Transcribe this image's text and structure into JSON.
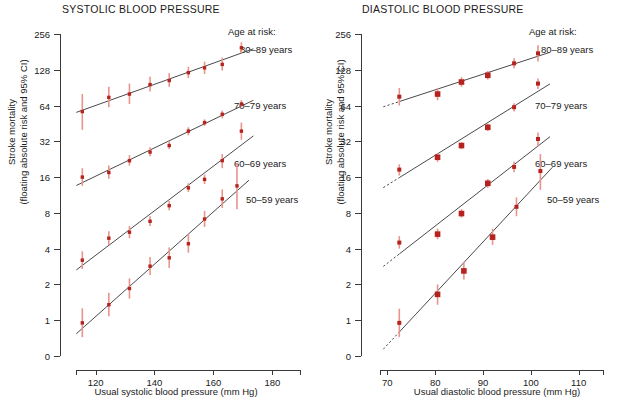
{
  "figure": {
    "ylabel_line1": "Stroke mortality",
    "ylabel_line2": "(floating absolute risk and 95% CI)",
    "legend_heading": "Age at risk:",
    "legend_items": [
      "80–89 years",
      "70–79 years",
      "60–69 years",
      "50–59 years"
    ],
    "point_color": "#b5231f",
    "ci_color": "#e8948c",
    "line_color": "#4a4a4a"
  },
  "chart_data": [
    {
      "type": "scatter",
      "title": "SYSTOLIC BLOOD PRESSURE",
      "xlabel": "Usual systolic blood pressure (mm Hg)",
      "ylabel": "Stroke mortality (floating absolute risk and 95% CI)",
      "yscale": "log2",
      "yticks": [
        0,
        1,
        2,
        4,
        8,
        16,
        32,
        64,
        128,
        256
      ],
      "ytick_labels": [
        "0",
        "1",
        "2",
        "4",
        "8",
        "16",
        "32",
        "64",
        "128",
        "256"
      ],
      "xticks": [
        120,
        140,
        160,
        180
      ],
      "xtick_labels": [
        "120",
        "140",
        "160",
        "180"
      ],
      "xlim": [
        112,
        186
      ],
      "grid": false,
      "legend_position": "right",
      "series": [
        {
          "name": "80–89 years",
          "x": [
            115.5,
            124.5,
            131.5,
            138.5,
            145.0,
            151.5,
            157.0,
            163.0,
            169.5
          ],
          "values": [
            57,
            75,
            80,
            96,
            104,
            121,
            133,
            142,
            196
          ],
          "ci_low": [
            40,
            62,
            66,
            84,
            92,
            109,
            118,
            126,
            176
          ],
          "ci_high": [
            80,
            92,
            98,
            112,
            120,
            136,
            150,
            162,
            218
          ]
        },
        {
          "name": "70–79 years",
          "x": [
            115.5,
            124.5,
            131.5,
            138.5,
            145.0,
            151.5,
            157.0,
            163.0,
            169.5
          ],
          "values": [
            16,
            17.5,
            22,
            26,
            29.5,
            39,
            46,
            54,
            66,
            99
          ],
          "ci_low": [
            13.5,
            15.5,
            20,
            24,
            27.5,
            36,
            43,
            50,
            62,
            90
          ],
          "ci_high": [
            19,
            20,
            24.5,
            28.5,
            32,
            42,
            49,
            58,
            71,
            109
          ]
        },
        {
          "name": "60–69 years",
          "x": [
            115.5,
            124.5,
            131.5,
            138.5,
            145.0,
            151.5,
            157.0,
            163.0,
            169.5
          ],
          "values": [
            3.2,
            4.9,
            5.5,
            6.8,
            9.2,
            13.0,
            15.3,
            22.0,
            39.0
          ],
          "ci_low": [
            2.7,
            4.3,
            4.9,
            6.2,
            8.4,
            12.0,
            14.0,
            19.0,
            33.0
          ],
          "ci_high": [
            3.8,
            5.6,
            6.2,
            7.5,
            10.1,
            14.2,
            16.8,
            25.0,
            46.0
          ]
        },
        {
          "name": "50–59 years",
          "x": [
            115.5,
            124.5,
            131.5,
            138.5,
            145.0,
            151.5,
            157.0,
            163.0,
            168.0
          ],
          "values": [
            0.95,
            1.35,
            1.85,
            2.85,
            3.35,
            4.4,
            7.1,
            10.5,
            13.5
          ],
          "ci_low": [
            0.72,
            1.08,
            1.52,
            2.4,
            2.75,
            3.7,
            6.1,
            8.8,
            8.6
          ],
          "ci_high": [
            1.26,
            1.7,
            2.25,
            3.4,
            4.1,
            5.3,
            8.3,
            12.6,
            21.0
          ]
        }
      ]
    },
    {
      "type": "scatter",
      "title": "DIASTOLIC BLOOD PRESSURE",
      "xlabel": "Usual diastolic blood pressure (mm Hg)",
      "ylabel": "Stroke mortality (floating absolute risk and 95% CI)",
      "yscale": "log2",
      "yticks": [
        0,
        1,
        2,
        4,
        8,
        16,
        32,
        64,
        128,
        256
      ],
      "ytick_labels": [
        "0",
        "1",
        "2",
        "4",
        "8",
        "16",
        "32",
        "64",
        "128",
        "256"
      ],
      "xticks": [
        70,
        80,
        90,
        100,
        110
      ],
      "xtick_labels": [
        "70",
        "80",
        "90",
        "100",
        "110"
      ],
      "xlim": [
        67,
        113
      ],
      "grid": false,
      "legend_position": "right",
      "series": [
        {
          "name": "80–89 years",
          "x": [
            72.5,
            80.5,
            85.5,
            91.0,
            96.5,
            101.5
          ],
          "values": [
            76,
            80,
            101,
            115,
            145,
            176
          ],
          "ci_low": [
            64,
            71,
            92,
            106,
            132,
            150
          ],
          "ci_high": [
            90,
            90,
            111,
            125,
            160,
            206
          ]
        },
        {
          "name": "70–79 years",
          "x": [
            72.5,
            80.5,
            85.5,
            91.0,
            96.5,
            101.5
          ],
          "values": [
            18.5,
            23.5,
            29.5,
            42,
            62,
            98
          ],
          "ci_low": [
            16.5,
            21.5,
            27.5,
            39,
            57,
            88
          ],
          "ci_high": [
            20.5,
            25.5,
            31.5,
            45,
            67,
            108
          ]
        },
        {
          "name": "60–69 years",
          "x": [
            72.5,
            80.5,
            85.5,
            91.0,
            96.5,
            101.5
          ],
          "values": [
            4.5,
            5.3,
            7.9,
            14.2,
            19.5,
            33.5
          ],
          "ci_low": [
            4.0,
            4.8,
            7.3,
            13.0,
            17.6,
            29.0
          ],
          "ci_high": [
            5.1,
            5.9,
            8.6,
            15.4,
            21.5,
            38.0
          ]
        },
        {
          "name": "50–59 years",
          "x": [
            72.5,
            80.5,
            86.0,
            92.0,
            97.0,
            102.0
          ],
          "values": [
            0.95,
            1.65,
            2.6,
            5.0,
            9.0,
            18.0
          ],
          "ci_low": [
            0.72,
            1.35,
            2.2,
            4.3,
            7.5,
            12.5
          ],
          "ci_high": [
            1.25,
            2.0,
            3.1,
            5.9,
            10.8,
            25.0
          ]
        }
      ]
    }
  ]
}
